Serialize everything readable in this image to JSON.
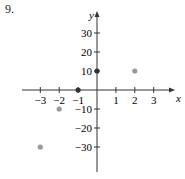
{
  "problem_number": "9.",
  "chart_data": {
    "type": "scatter",
    "title": "",
    "xlabel": "x",
    "ylabel": "y",
    "xlim": [
      -3.5,
      3.5
    ],
    "ylim": [
      -40,
      35
    ],
    "x_ticks": [
      -3,
      -2,
      -1,
      1,
      2,
      3
    ],
    "y_ticks": [
      -30,
      -20,
      -10,
      10,
      20,
      30
    ],
    "x_tick_labels": [
      "−3",
      "−2",
      "−1",
      "1",
      "2",
      "3"
    ],
    "y_tick_labels": [
      "−30",
      "−20",
      "−10",
      "10",
      "20",
      "30"
    ],
    "grid": false,
    "legend": null,
    "points": [
      {
        "x": -3,
        "y": -30,
        "color": "#999999"
      },
      {
        "x": -2,
        "y": -10,
        "color": "#999999"
      },
      {
        "x": -1,
        "y": 0,
        "color": "#333333"
      },
      {
        "x": 0,
        "y": 10,
        "color": "#333333"
      },
      {
        "x": 2,
        "y": 10,
        "color": "#999999"
      }
    ]
  }
}
